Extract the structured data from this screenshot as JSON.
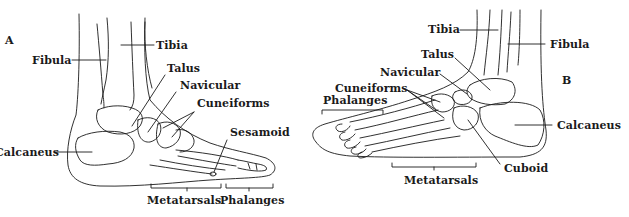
{
  "figure": {
    "panels": [
      {
        "id": "A",
        "letter": "A",
        "view": "medial",
        "labels": {
          "fibula": "Fibula",
          "tibia": "Tibia",
          "talus": "Talus",
          "navicular": "Navicular",
          "cuneiforms": "Cuneiforms",
          "sesamoid": "Sesamoid",
          "calcaneus": "Calcaneus",
          "metatarsals": "Metatarsals",
          "phalanges": "Phalanges"
        }
      },
      {
        "id": "B",
        "letter": "B",
        "view": "lateral",
        "labels": {
          "tibia": "Tibia",
          "fibula": "Fibula",
          "talus": "Talus",
          "navicular": "Navicular",
          "cuneiforms": "Cuneiforms",
          "phalanges": "Phalanges",
          "calcaneus": "Calcaneus",
          "cuboid": "Cuboid",
          "metatarsals": "Metatarsals"
        }
      }
    ],
    "colors": {
      "line": "#1a1a1a",
      "background": "#ffffff",
      "dots": "#888888"
    }
  }
}
